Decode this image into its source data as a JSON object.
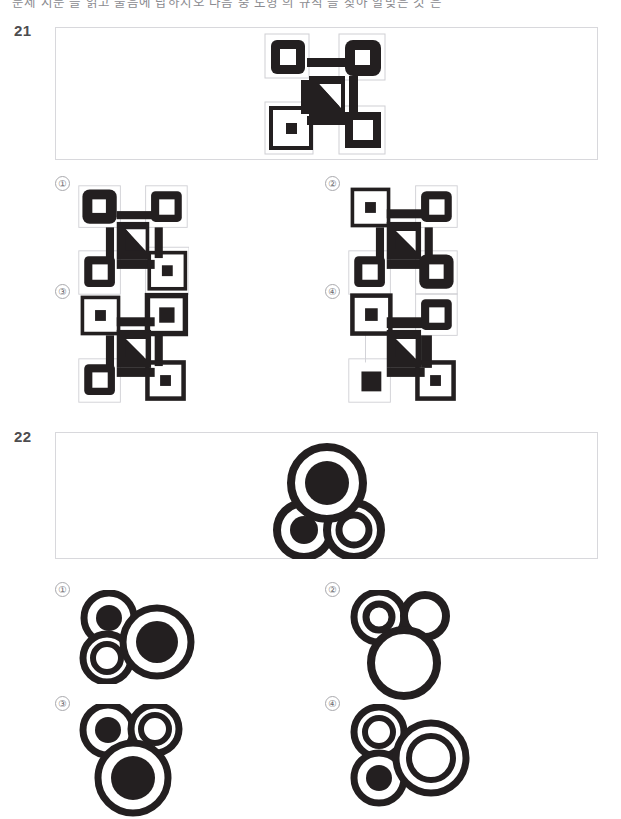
{
  "page": {
    "width": 621,
    "height": 811,
    "background": "#ffffff",
    "ink": "#231f20",
    "box_border": "#d8d8dc",
    "thin_frame": "#cfcfd4",
    "label_color": "#4d4d4f",
    "option_num_color": "#6b6b70",
    "header_text": "문제 지문 을 읽고 물음에 답하시오 다음 중 도형 의 규칙 을 찾아 알맞은 것 은"
  },
  "questions": [
    {
      "number": "21",
      "type": "qr-pattern",
      "number_pos": {
        "x": 14,
        "y": 22
      },
      "stem_box": {
        "x": 55,
        "y": 27,
        "w": 543,
        "h": 133
      },
      "stem_figure": {
        "x": 262,
        "y": 31,
        "size": 124,
        "name": "stem-figure-21",
        "cells": [
          {
            "pos": "top-left",
            "style": "black-ring-white-center",
            "frame": "light"
          },
          {
            "pos": "top-right",
            "style": "black-filled-white-center",
            "frame": "light"
          },
          {
            "pos": "bottom-left",
            "style": "thin-ring-small-black-dot",
            "frame": "none"
          },
          {
            "pos": "bottom-right",
            "style": "black-ring-white-center",
            "frame": "light"
          }
        ],
        "center": {
          "style": "black-square-white-triangle-upper-right"
        },
        "connectors": [
          "top-horizontal",
          "left-vertical",
          "right-vertical",
          "bottom-horizontal"
        ]
      },
      "options": [
        {
          "label": "①",
          "name": "option-21-1",
          "x": 55,
          "y": 176,
          "fig_size": 110,
          "cells": [
            {
              "pos": "top-left",
              "style": "black-filled-white-center",
              "frame": "light"
            },
            {
              "pos": "top-right",
              "style": "black-ring-white-center",
              "frame": "light"
            },
            {
              "pos": "bottom-left",
              "style": "black-ring-white-center",
              "frame": "light"
            },
            {
              "pos": "bottom-right",
              "style": "thin-ring-small-black-dot",
              "frame": "none"
            }
          ],
          "center": {
            "style": "black-square-white-triangle-lower-right"
          }
        },
        {
          "label": "②",
          "name": "option-21-2",
          "x": 325,
          "y": 176,
          "fig_size": 110,
          "cells": [
            {
              "pos": "top-left",
              "style": "thin-ring-small-black-dot",
              "frame": "none"
            },
            {
              "pos": "top-right",
              "style": "black-filled-white-center",
              "frame": "light"
            },
            {
              "pos": "bottom-left",
              "style": "black-ring-white-center",
              "frame": "light"
            },
            {
              "pos": "bottom-right",
              "style": "black-filled-white-center",
              "frame": "light"
            }
          ],
          "center": {
            "style": "black-square-white-triangle-upper-right"
          }
        },
        {
          "label": "③",
          "name": "option-21-3",
          "x": 55,
          "y": 284,
          "fig_size": 110,
          "cells": [
            {
              "pos": "top-left",
              "style": "thin-ring-small-black-dot",
              "frame": "none"
            },
            {
              "pos": "top-right",
              "style": "thin-ring-black-center",
              "frame": "none"
            },
            {
              "pos": "bottom-left",
              "style": "black-ring-white-center",
              "frame": "light"
            },
            {
              "pos": "bottom-right",
              "style": "thin-ring-small-black-dot",
              "frame": "none"
            }
          ],
          "center": {
            "style": "black-square-white-triangle-upper-right"
          }
        },
        {
          "label": "④",
          "name": "option-21-4",
          "x": 325,
          "y": 284,
          "fig_size": 110,
          "cells": [
            {
              "pos": "top-left",
              "style": "thin-ring-small-black-dot",
              "frame": "none"
            },
            {
              "pos": "top-right",
              "style": "black-ring-white-center",
              "frame": "light"
            },
            {
              "pos": "bottom-left",
              "style": "thin-ring-black-center",
              "frame": "none"
            },
            {
              "pos": "bottom-right",
              "style": "thin-ring-small-black-dot",
              "frame": "none"
            }
          ],
          "center": {
            "style": "black-square-white-triangle-upper-right"
          }
        }
      ]
    },
    {
      "number": "22",
      "type": "circles-pattern",
      "number_pos": {
        "x": 14,
        "y": 428
      },
      "stem_box": {
        "x": 55,
        "y": 432,
        "w": 543,
        "h": 127
      },
      "stem_figure": {
        "x": 268,
        "y": 440,
        "w": 115,
        "h": 118,
        "name": "stem-figure-22",
        "circles": [
          {
            "role": "big",
            "cx": 58,
            "cy": 42,
            "r": 36,
            "fill": "black-core"
          },
          {
            "role": "small-left",
            "cx": 35,
            "cy": 89,
            "r": 27,
            "fill": "black-core"
          },
          {
            "role": "small-right",
            "cx": 85,
            "cy": 89,
            "r": 27,
            "fill": "hollow"
          }
        ]
      },
      "options": [
        {
          "label": "①",
          "name": "option-22-1",
          "x": 55,
          "y": 582,
          "w": 120,
          "h": 80,
          "circles": [
            {
              "role": "small-a",
              "cx": 32,
              "cy": 30,
              "r": 25,
              "fill": "black-core"
            },
            {
              "role": "small-b",
              "cx": 30,
              "cy": 70,
              "r": 24,
              "fill": "hollow"
            },
            {
              "role": "big",
              "cx": 80,
              "cy": 52,
              "r": 34,
              "fill": "black-core"
            }
          ]
        },
        {
          "label": "②",
          "name": "option-22-2",
          "x": 325,
          "y": 582,
          "w": 120,
          "h": 90,
          "circles": [
            {
              "role": "small-a",
              "cx": 32,
              "cy": 27,
              "r": 25,
              "fill": "hollow"
            },
            {
              "role": "small-b",
              "cx": 78,
              "cy": 26,
              "r": 21,
              "fill": "hollow"
            },
            {
              "role": "big",
              "cx": 57,
              "cy": 73,
              "r": 33,
              "fill": "hollow"
            }
          ]
        },
        {
          "label": "③",
          "name": "option-22-3",
          "x": 55,
          "y": 696,
          "w": 120,
          "h": 95,
          "circles": [
            {
              "role": "small-a",
              "cx": 31,
              "cy": 26,
              "r": 25,
              "fill": "black-core"
            },
            {
              "role": "small-b",
              "cx": 78,
              "cy": 25,
              "r": 24,
              "fill": "hollow"
            },
            {
              "role": "big",
              "cx": 56,
              "cy": 74,
              "r": 35,
              "fill": "black-core"
            }
          ]
        },
        {
          "label": "④",
          "name": "option-22-4",
          "x": 325,
          "y": 696,
          "w": 125,
          "h": 95,
          "circles": [
            {
              "role": "small-a",
              "cx": 32,
              "cy": 28,
              "r": 25,
              "fill": "hollow"
            },
            {
              "role": "small-b",
              "cx": 32,
              "cy": 74,
              "r": 25,
              "fill": "black-core"
            },
            {
              "role": "big",
              "cx": 84,
              "cy": 54,
              "r": 35,
              "fill": "hollow"
            }
          ]
        }
      ]
    }
  ]
}
